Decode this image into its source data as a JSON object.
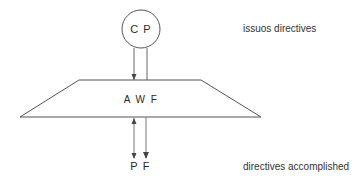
{
  "diagram": {
    "nodes": {
      "top_node": {
        "label": "C P",
        "shape": "circle"
      },
      "middle_node": {
        "label": "A W F",
        "shape": "trapezoid"
      },
      "bottom_left": {
        "label": "P"
      },
      "bottom_right": {
        "label": "F"
      }
    },
    "annotations": {
      "top": "issuos directives",
      "bottom": "directives accomplished"
    },
    "edges": [
      {
        "from": "C P",
        "to": "A W F",
        "arrow": "down"
      },
      {
        "from": "C P",
        "to": "A W F",
        "arrow": "none"
      },
      {
        "from": "P",
        "to": "A W F",
        "arrow": "both"
      },
      {
        "from": "A W F",
        "to": "F",
        "arrow": "down"
      }
    ],
    "colors": {
      "stroke": "#555555",
      "text": "#2a2a2a",
      "background": "#ffffff"
    }
  }
}
